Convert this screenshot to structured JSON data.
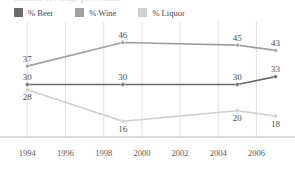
{
  "clipped_header_text": "alcohol beverage preference",
  "legend": {
    "position": "top-left",
    "items": [
      {
        "label": "% Beer",
        "color": "#6b6b6b",
        "icon": "legend-swatch-icon"
      },
      {
        "label": "% Wine",
        "color": "#a0a0a0",
        "icon": "legend-swatch-icon"
      },
      {
        "label": "% Liquor",
        "color": "#cfcfcf",
        "icon": "legend-swatch-icon"
      }
    ]
  },
  "chart_data": {
    "type": "line",
    "title": "",
    "xlabel": "",
    "ylabel": "",
    "x": [
      1994,
      1999,
      2005,
      2007
    ],
    "xlim": [
      1993.3,
      2007.6
    ],
    "ylim": [
      10,
      50
    ],
    "grid": "vertical",
    "tick_labels": [
      "1994",
      "1996",
      "1998",
      "2000",
      "2002",
      "2004",
      "2006"
    ],
    "tick_values": [
      1994,
      1996,
      1998,
      2000,
      2002,
      2004,
      2006
    ],
    "legend_position": "top-left",
    "series": [
      {
        "name": "% Beer",
        "color": "#6b6b6b",
        "values": [
          30,
          30,
          30,
          33
        ],
        "point_labels": [
          "30",
          "30",
          "30",
          "33"
        ],
        "label_positions": [
          "above",
          "above",
          "above",
          "above"
        ]
      },
      {
        "name": "% Wine",
        "color": "#a0a0a0",
        "values": [
          37,
          46,
          45,
          43
        ],
        "point_labels": [
          "37",
          "46",
          "45",
          "43"
        ],
        "label_positions": [
          "above",
          "above",
          "above",
          "above"
        ]
      },
      {
        "name": "% Liquor",
        "color": "#cfcfcf",
        "values": [
          28,
          16,
          20,
          18
        ],
        "point_labels": [
          "28",
          "16",
          "20",
          "18"
        ],
        "label_positions": [
          "below",
          "below",
          "below",
          "below"
        ]
      }
    ]
  },
  "axis": {
    "baseline_color": "#bdbdbd",
    "gridline_color": "#e2e2e2"
  }
}
